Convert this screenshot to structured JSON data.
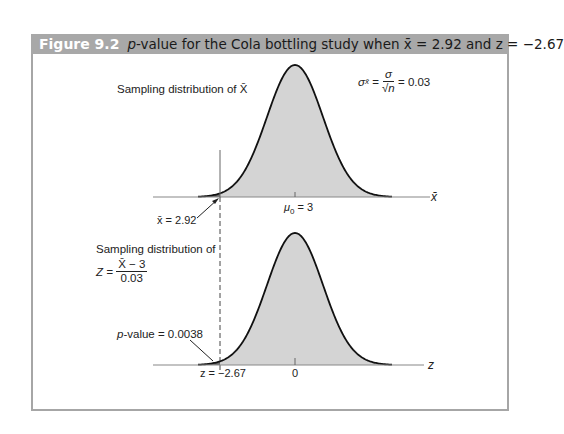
{
  "figure": {
    "number": "Figure 9.2",
    "caption_p": "p",
    "caption_rest": "-value for the Cola bottling study when x̄ = 2.92 and z = −2.67"
  },
  "colors": {
    "title_bar": "#a8a8a8",
    "frame": "#a6a6a6",
    "curve_fill": "#d4d4d4",
    "tail_fill": "#6e6e6e",
    "curve_stroke": "#111111",
    "axis": "#888888"
  },
  "top_panel": {
    "label": "Sampling distribution of X̄",
    "sigma_lhs": "σ",
    "sigma_sub": "x̄",
    "sigma_num": "σ",
    "sigma_den": "√n",
    "sigma_value": "= 0.03",
    "mean_label": "μ",
    "mean_sub": "0",
    "mean_value": "= 3",
    "xbar_callout": "x̄ = 2.92",
    "axis_label": "x̄"
  },
  "bottom_panel": {
    "label_line1": "Sampling distribution of",
    "z_lhs": "Z =",
    "z_num": "X̄ − 3",
    "z_den": "0.03",
    "pvalue_p": "p",
    "pvalue_rest": "-value = 0.0038",
    "z_callout": "z = −2.67",
    "zero_label": "0",
    "axis_label": "z"
  },
  "chart_data": [
    {
      "type": "area",
      "title": "Sampling distribution of X̄",
      "xlabel": "x̄",
      "distribution": "normal",
      "mean": 3,
      "std_error": 0.03,
      "observed": 2.92,
      "shaded_left_tail_below": 2.92,
      "annotations": [
        "σ_x̄ = σ/√n = 0.03",
        "μ0 = 3",
        "x̄ = 2.92"
      ]
    },
    {
      "type": "area",
      "title": "Sampling distribution of Z = (X̄ − 3)/0.03",
      "xlabel": "z",
      "distribution": "standard normal",
      "mean": 0,
      "std": 1,
      "observed": -2.67,
      "p_value": 0.0038,
      "shaded_left_tail_below": -2.67,
      "annotations": [
        "p-value = 0.0038",
        "z = −2.67",
        "0"
      ]
    }
  ]
}
